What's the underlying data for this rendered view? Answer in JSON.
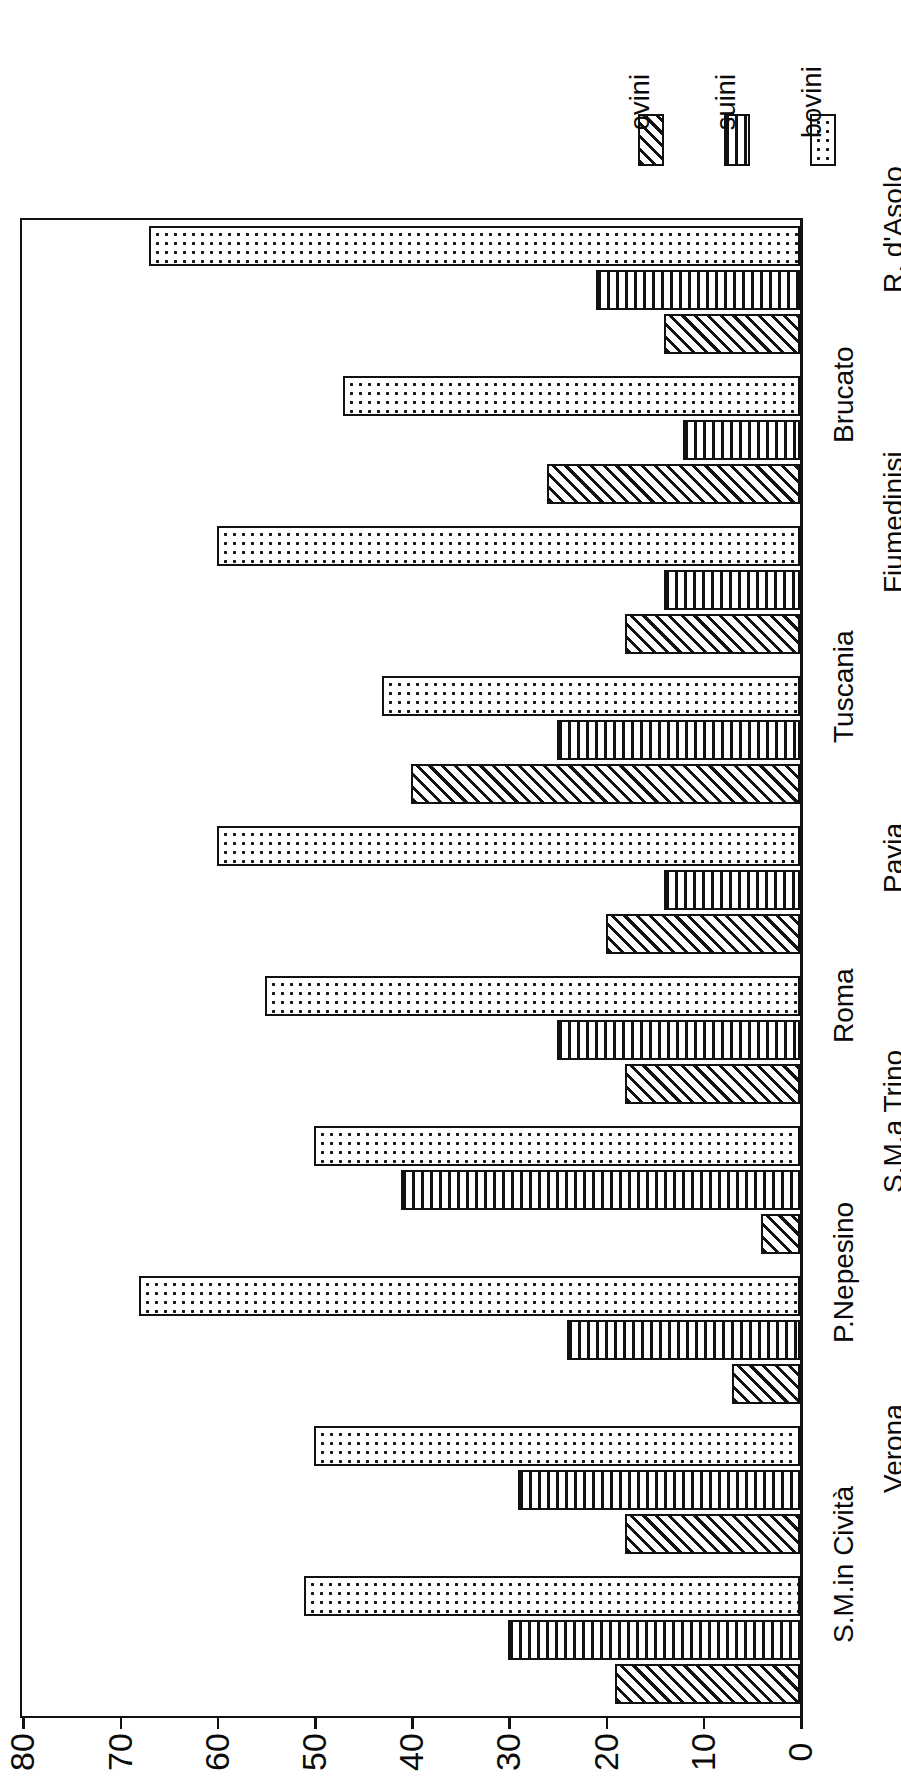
{
  "chart_data": {
    "type": "bar",
    "orientation": "horizontal",
    "title": "",
    "xlabel": "",
    "ylabel": "",
    "xlim": [
      0,
      80
    ],
    "xticks": [
      0,
      10,
      20,
      30,
      40,
      50,
      60,
      70,
      80
    ],
    "grid": false,
    "legend_position": "top-right",
    "categories": [
      "S.M.in Cività",
      "Verona",
      "P.Nepesino",
      "S.M.a Trino",
      "Roma",
      "Pavia",
      "Tuscania",
      "Fiumedinisi",
      "Brucato",
      "R. d'Asolo"
    ],
    "series": [
      {
        "name": "ovini",
        "pattern": "diagonal-hatch",
        "values": [
          19,
          18,
          7,
          4,
          18,
          20,
          40,
          18,
          26,
          14
        ]
      },
      {
        "name": "suini",
        "pattern": "vertical-lines",
        "values": [
          30,
          29,
          24,
          41,
          25,
          14,
          25,
          14,
          12,
          21
        ]
      },
      {
        "name": "bovini",
        "pattern": "dotted",
        "values": [
          51,
          50,
          68,
          50,
          55,
          60,
          43,
          60,
          47,
          67
        ]
      }
    ]
  },
  "legend": {
    "items": [
      {
        "label": "ovini",
        "pattern": "diagonal-hatch"
      },
      {
        "label": "suini",
        "pattern": "vertical-lines"
      },
      {
        "label": "bovini",
        "pattern": "dotted"
      }
    ]
  },
  "axis": {
    "tick_labels": [
      "80",
      "70",
      "60",
      "50",
      "40",
      "30",
      "20",
      "10",
      "0"
    ],
    "max": 80,
    "min": 0
  },
  "colors": {
    "ink": "#111111",
    "paper": "#ffffff"
  }
}
